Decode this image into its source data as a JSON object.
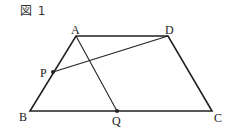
{
  "caption": "図 1",
  "points": {
    "A": {
      "label": "A",
      "x": 76,
      "y": 36
    },
    "B": {
      "label": "B",
      "x": 30,
      "y": 111
    },
    "C": {
      "label": "C",
      "x": 212,
      "y": 111
    },
    "D": {
      "label": "D",
      "x": 168,
      "y": 36
    },
    "P": {
      "label": "P",
      "x": 53,
      "y": 72
    },
    "Q": {
      "label": "Q",
      "x": 117,
      "y": 111
    }
  },
  "segments": [
    {
      "from": "A",
      "to": "D",
      "role": "side"
    },
    {
      "from": "D",
      "to": "C",
      "role": "side"
    },
    {
      "from": "C",
      "to": "B",
      "role": "side"
    },
    {
      "from": "B",
      "to": "A",
      "role": "side"
    },
    {
      "from": "A",
      "to": "Q",
      "role": "interior"
    },
    {
      "from": "P",
      "to": "D",
      "role": "interior"
    }
  ],
  "marked_points": [
    "P",
    "Q"
  ],
  "colors": {
    "stroke": "#222222",
    "text": "#222222"
  }
}
